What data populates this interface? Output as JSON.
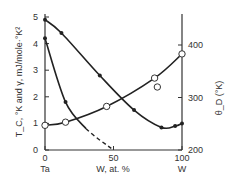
{
  "chart_data": {
    "type": "line",
    "title": "",
    "xlabel": "W, at. %",
    "x_end_labels": {
      "left": "Ta",
      "right": "W"
    },
    "ylabel_left": "T_C, °K and γ, mJ/mole·°K²",
    "ylabel_right": "θ_D (°K)",
    "xlim": [
      0,
      100
    ],
    "ylim_left": [
      0,
      5
    ],
    "ylim_right": [
      200,
      400
    ],
    "x_ticks": [
      "0",
      "50",
      "100"
    ],
    "y_ticks_left": [
      "0",
      "1",
      "2",
      "3",
      "4",
      "5"
    ],
    "y_ticks_right": [
      "200",
      "300",
      "400"
    ],
    "grid": false,
    "series": [
      {
        "name": "gamma",
        "axis": "left",
        "marker": "filled-circle",
        "style": "solid",
        "x": [
          0,
          12,
          40,
          65,
          85,
          95,
          100
        ],
        "y": [
          4.9,
          4.4,
          2.8,
          1.5,
          0.85,
          0.9,
          1.0
        ]
      },
      {
        "name": "Tc",
        "axis": "left",
        "marker": "filled-circle",
        "style": "solid-then-dashed",
        "x": [
          0,
          15,
          30,
          50
        ],
        "y": [
          4.2,
          1.8,
          0.8,
          0.0
        ]
      },
      {
        "name": "theta_D",
        "axis": "right",
        "marker": "open-circle",
        "style": "solid",
        "x": [
          0,
          15,
          45,
          80,
          100
        ],
        "y": [
          247,
          253,
          283,
          337,
          383
        ]
      },
      {
        "name": "theta_D-outlier",
        "axis": "right",
        "marker": "open-circle",
        "style": "none",
        "x": [
          82
        ],
        "y": [
          320
        ]
      }
    ]
  }
}
